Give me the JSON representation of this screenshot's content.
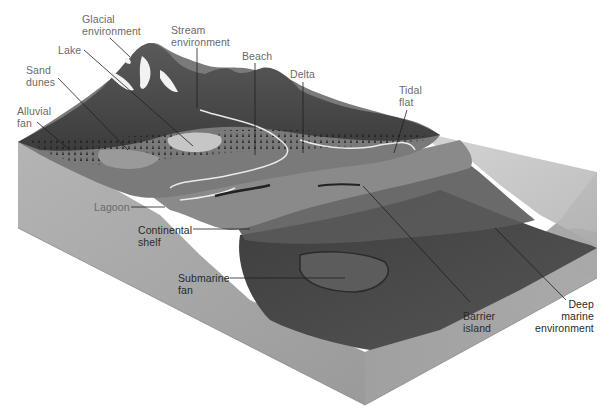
{
  "figure": {
    "type": "block-diagram",
    "colors": {
      "background": "#ffffff",
      "block_left_face": "#a9a9a9",
      "block_front_face": "#9c9c9c",
      "block_right_face": "#a3a3a3",
      "sea_surface": "#c2c2c2",
      "land_dark": "#4a4a4a",
      "land_mid": "#7a7a7a",
      "shelf": "#8e8e8e",
      "slope_dark": "#3e3e3e",
      "glacier": "#f2f2f2",
      "label_light": "#6a6a6a",
      "label_dark": "#2a2a2a",
      "leader_line": "#1e1e1e"
    }
  },
  "labels": {
    "glacial": "Glacial\nenvironment",
    "stream": "Stream\nenvironment",
    "lake": "Lake",
    "beach": "Beach",
    "delta": "Delta",
    "sand_dunes": "Sand\ndunes",
    "alluvial_fan": "Alluvial\nfan",
    "tidal_flat": "Tidal\nflat",
    "lagoon": "Lagoon",
    "continental_shelf": "Continental\nshelf",
    "submarine_fan": "Submarine\nfan",
    "barrier_island": "Barrier\nisland",
    "deep_marine": "Deep\nmarine\nenvironment"
  }
}
